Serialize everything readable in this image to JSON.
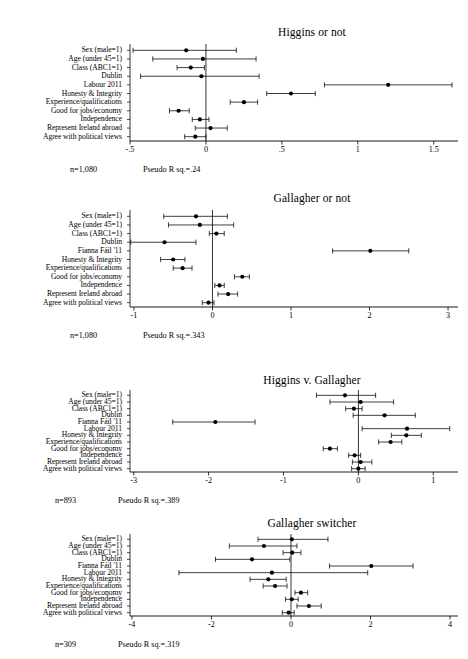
{
  "figure": {
    "background": "#ffffff",
    "marker_color": "#000000",
    "line_color": "#000000"
  },
  "panels": [
    {
      "id": "higgins-or-not",
      "title": "Higgins or not",
      "n_label": "n=1,080",
      "r_label": "Pseudo R sq.=.24",
      "xticks": [
        "-.5",
        "0",
        ".5",
        "1",
        "1.5"
      ],
      "xtickvals": [
        -0.5,
        0,
        0.5,
        1,
        1.5
      ],
      "xlim": [
        -0.5,
        1.62
      ],
      "rows": [
        {
          "label": "Sex (male=1)",
          "est": -0.13,
          "lo": -0.48,
          "hi": 0.2
        },
        {
          "label": "Age (under 45=1)",
          "est": -0.02,
          "lo": -0.35,
          "hi": 0.33
        },
        {
          "label": "Class (ABC1=1)",
          "est": -0.1,
          "lo": -0.19,
          "hi": -0.01
        },
        {
          "label": "Dublin",
          "est": -0.03,
          "lo": -0.43,
          "hi": 0.35
        },
        {
          "label": "Labour 2011",
          "est": 1.2,
          "lo": 0.78,
          "hi": 1.62
        },
        {
          "label": "Honesty & Integrity",
          "est": 0.56,
          "lo": 0.4,
          "hi": 0.72
        },
        {
          "label": "Experience/qualifications",
          "est": 0.25,
          "lo": 0.16,
          "hi": 0.34
        },
        {
          "label": "Good for jobs/economy",
          "est": -0.18,
          "lo": -0.24,
          "hi": -0.11
        },
        {
          "label": "Independence",
          "est": -0.04,
          "lo": -0.09,
          "hi": 0.02
        },
        {
          "label": "Represent Ireland abroad",
          "est": 0.03,
          "lo": -0.07,
          "hi": 0.14
        },
        {
          "label": "Agree with political views",
          "est": -0.07,
          "lo": -0.14,
          "hi": 0.0
        }
      ]
    },
    {
      "id": "gallagher-or-not",
      "title": "Gallagher or not",
      "n_label": "n=1,080",
      "r_label": "Pseudo R sq.=.343",
      "xticks": [
        "-1",
        "0",
        "1",
        "2",
        "3"
      ],
      "xtickvals": [
        -1,
        0,
        1,
        2,
        3
      ],
      "xlim": [
        -1.05,
        3.05
      ],
      "rows": [
        {
          "label": "Sex (male=1)",
          "est": -0.21,
          "lo": -0.62,
          "hi": 0.19
        },
        {
          "label": "Age (under 45=1)",
          "est": -0.16,
          "lo": -0.56,
          "hi": 0.27
        },
        {
          "label": "Class (ABC1=1)",
          "est": 0.05,
          "lo": -0.04,
          "hi": 0.15
        },
        {
          "label": "Dublin",
          "est": -0.61,
          "lo": -1.04,
          "hi": -0.21
        },
        {
          "label": "Fianna Fáil '11",
          "est": 2.01,
          "lo": 1.53,
          "hi": 2.5
        },
        {
          "label": "Honesty & Integrity",
          "est": -0.5,
          "lo": -0.66,
          "hi": -0.35
        },
        {
          "label": "Experience/qualifications",
          "est": -0.38,
          "lo": -0.5,
          "hi": -0.26
        },
        {
          "label": "Good for jobs/economy",
          "est": 0.38,
          "lo": 0.28,
          "hi": 0.47
        },
        {
          "label": "Independence",
          "est": 0.09,
          "lo": 0.03,
          "hi": 0.15
        },
        {
          "label": "Represent Ireland abroad",
          "est": 0.2,
          "lo": 0.07,
          "hi": 0.32
        },
        {
          "label": "Agree with political views",
          "est": -0.05,
          "lo": -0.13,
          "hi": 0.02
        }
      ]
    },
    {
      "id": "higgins-v-gallagher",
      "title": "Higgins v. Gallagher",
      "n_label": "n=893",
      "r_label": "Pseudo R sq.=.389",
      "xticks": [
        "-3",
        "-2",
        "-1",
        "0",
        "1"
      ],
      "xtickvals": [
        -3,
        -2,
        -1,
        0,
        1
      ],
      "xlim": [
        -3.05,
        1.25
      ],
      "rows": [
        {
          "label": "Sex (male=1)",
          "est": -0.18,
          "lo": -0.56,
          "hi": 0.23
        },
        {
          "label": "Age (under 45=1)",
          "est": 0.03,
          "lo": -0.38,
          "hi": 0.47
        },
        {
          "label": "Class (ABC1=1)",
          "est": -0.06,
          "lo": -0.17,
          "hi": 0.05
        },
        {
          "label": "Dublin",
          "est": 0.35,
          "lo": -0.07,
          "hi": 0.76
        },
        {
          "label": "Fianna Fáil '11",
          "est": -1.91,
          "lo": -2.48,
          "hi": -1.38
        },
        {
          "label": "Labour 2011",
          "est": 0.65,
          "lo": 0.05,
          "hi": 1.22
        },
        {
          "label": "Honesty & Integrity",
          "est": 0.64,
          "lo": 0.44,
          "hi": 0.84
        },
        {
          "label": "Experience/qualifications",
          "est": 0.43,
          "lo": 0.27,
          "hi": 0.58
        },
        {
          "label": "Good for jobs/economy",
          "est": -0.38,
          "lo": -0.47,
          "hi": -0.28
        },
        {
          "label": "Independence",
          "est": -0.05,
          "lo": -0.13,
          "hi": 0.03
        },
        {
          "label": "Represent Ireland abroad",
          "est": 0.03,
          "lo": -0.08,
          "hi": 0.18
        },
        {
          "label": "Agree with political views",
          "est": 0.0,
          "lo": -0.09,
          "hi": 0.09
        }
      ]
    },
    {
      "id": "gallagher-switcher",
      "title": "Gallagher switcher",
      "n_label": "n=309",
      "r_label": "Pseudo R sq.=.319",
      "xticks": [
        "-4",
        "-2",
        "0",
        "2",
        "4"
      ],
      "xtickvals": [
        -4,
        -2,
        0,
        2,
        4
      ],
      "xlim": [
        -4.05,
        4.05
      ],
      "rows": [
        {
          "label": "Sex (male=1)",
          "est": 0.02,
          "lo": -0.83,
          "hi": 0.93
        },
        {
          "label": "Age (under 45=1)",
          "est": -0.68,
          "lo": -1.55,
          "hi": 0.15
        },
        {
          "label": "Class (ABC1=1)",
          "est": 0.03,
          "lo": -0.2,
          "hi": 0.25
        },
        {
          "label": "Dublin",
          "est": -0.98,
          "lo": -1.9,
          "hi": -0.03
        },
        {
          "label": "Fianna Fáil '11",
          "est": 2.02,
          "lo": 0.97,
          "hi": 3.07
        },
        {
          "label": "Labour 2011",
          "est": -0.48,
          "lo": -2.82,
          "hi": 1.93
        },
        {
          "label": "Honesty & Integrity",
          "est": -0.57,
          "lo": -1.03,
          "hi": -0.12
        },
        {
          "label": "Experience/qualifications",
          "est": -0.4,
          "lo": -0.7,
          "hi": -0.1
        },
        {
          "label": "Good for jobs/economy",
          "est": 0.25,
          "lo": 0.1,
          "hi": 0.42
        },
        {
          "label": "Independence",
          "est": 0.02,
          "lo": -0.14,
          "hi": 0.18
        },
        {
          "label": "Represent Ireland abroad",
          "est": 0.45,
          "lo": 0.15,
          "hi": 0.76
        },
        {
          "label": "Agree with political views",
          "est": -0.06,
          "lo": -0.22,
          "hi": 0.08
        }
      ]
    }
  ],
  "chart_data": {
    "type": "scatter",
    "xlabel": "",
    "ylabel": "",
    "grid": false,
    "legend": null,
    "panels": [
      {
        "title": "Higgins or not",
        "xlim": [
          -0.5,
          1.62
        ],
        "xticks": [
          -0.5,
          0,
          0.5,
          1,
          1.5
        ],
        "reference_line": 0,
        "n": "n=1,080",
        "pseudo_r_sq": "Pseudo R sq.=.24",
        "categories": [
          "Sex (male=1)",
          "Age (under 45=1)",
          "Class (ABC1=1)",
          "Dublin",
          "Labour 2011",
          "Honesty & Integrity",
          "Experience/qualifications",
          "Good for jobs/economy",
          "Independence",
          "Represent Ireland abroad",
          "Agree with political views"
        ],
        "estimates": [
          -0.13,
          -0.02,
          -0.1,
          -0.03,
          1.2,
          0.56,
          0.25,
          -0.18,
          -0.04,
          0.03,
          -0.07
        ],
        "ci_low": [
          -0.48,
          -0.35,
          -0.19,
          -0.43,
          0.78,
          0.4,
          0.16,
          -0.24,
          -0.09,
          -0.07,
          -0.14
        ],
        "ci_high": [
          0.2,
          0.33,
          -0.01,
          0.35,
          1.62,
          0.72,
          0.34,
          -0.11,
          0.02,
          0.14,
          0.0
        ]
      },
      {
        "title": "Gallagher or not",
        "xlim": [
          -1.05,
          3.05
        ],
        "xticks": [
          -1,
          0,
          1,
          2,
          3
        ],
        "reference_line": 0,
        "n": "n=1,080",
        "pseudo_r_sq": "Pseudo R sq.=.343",
        "categories": [
          "Sex (male=1)",
          "Age (under 45=1)",
          "Class (ABC1=1)",
          "Dublin",
          "Fianna Fáil '11",
          "Honesty & Integrity",
          "Experience/qualifications",
          "Good for jobs/economy",
          "Independence",
          "Represent Ireland abroad",
          "Agree with political views"
        ],
        "estimates": [
          -0.21,
          -0.16,
          0.05,
          -0.61,
          2.01,
          -0.5,
          -0.38,
          0.38,
          0.09,
          0.2,
          -0.05
        ],
        "ci_low": [
          -0.62,
          -0.56,
          -0.04,
          -1.04,
          1.53,
          -0.66,
          -0.5,
          0.28,
          0.03,
          0.07,
          -0.13
        ],
        "ci_high": [
          0.19,
          0.27,
          0.15,
          -0.21,
          2.5,
          -0.35,
          -0.26,
          0.47,
          0.15,
          0.32,
          0.02
        ]
      },
      {
        "title": "Higgins v. Gallagher",
        "xlim": [
          -3.05,
          1.25
        ],
        "xticks": [
          -3,
          -2,
          -1,
          0,
          1
        ],
        "reference_line": 0,
        "n": "n=893",
        "pseudo_r_sq": "Pseudo R sq.=.389",
        "categories": [
          "Sex (male=1)",
          "Age (under 45=1)",
          "Class (ABC1=1)",
          "Dublin",
          "Fianna Fáil '11",
          "Labour 2011",
          "Honesty & Integrity",
          "Experience/qualifications",
          "Good for jobs/economy",
          "Independence",
          "Represent Ireland abroad",
          "Agree with political views"
        ],
        "estimates": [
          -0.18,
          0.03,
          -0.06,
          0.35,
          -1.91,
          0.65,
          0.64,
          0.43,
          -0.38,
          -0.05,
          0.03,
          0.0
        ],
        "ci_low": [
          -0.56,
          -0.38,
          -0.17,
          -0.07,
          -2.48,
          0.05,
          0.44,
          0.27,
          -0.47,
          -0.13,
          -0.08,
          -0.09
        ],
        "ci_high": [
          0.23,
          0.47,
          0.05,
          0.76,
          -1.38,
          1.22,
          0.84,
          0.58,
          -0.28,
          0.03,
          0.18,
          0.09
        ]
      },
      {
        "title": "Gallagher switcher",
        "xlim": [
          -4.05,
          4.05
        ],
        "xticks": [
          -4,
          -2,
          0,
          2,
          4
        ],
        "reference_line": 0,
        "n": "n=309",
        "pseudo_r_sq": "Pseudo R sq.=.319",
        "categories": [
          "Sex (male=1)",
          "Age (under 45=1)",
          "Class (ABC1=1)",
          "Dublin",
          "Fianna Fáil '11",
          "Labour 2011",
          "Honesty & Integrity",
          "Experience/qualifications",
          "Good for jobs/economy",
          "Independence",
          "Represent Ireland abroad",
          "Agree with political views"
        ],
        "estimates": [
          0.02,
          -0.68,
          0.03,
          -0.98,
          2.02,
          -0.48,
          -0.57,
          -0.4,
          0.25,
          0.02,
          0.45,
          -0.06
        ],
        "ci_low": [
          -0.83,
          -1.55,
          -0.2,
          -1.9,
          0.97,
          -2.82,
          -1.03,
          -0.7,
          0.1,
          -0.14,
          0.15,
          -0.22
        ],
        "ci_high": [
          0.93,
          0.15,
          0.25,
          -0.03,
          3.07,
          1.93,
          -0.12,
          -0.1,
          0.42,
          0.18,
          0.76,
          0.08
        ]
      }
    ]
  }
}
